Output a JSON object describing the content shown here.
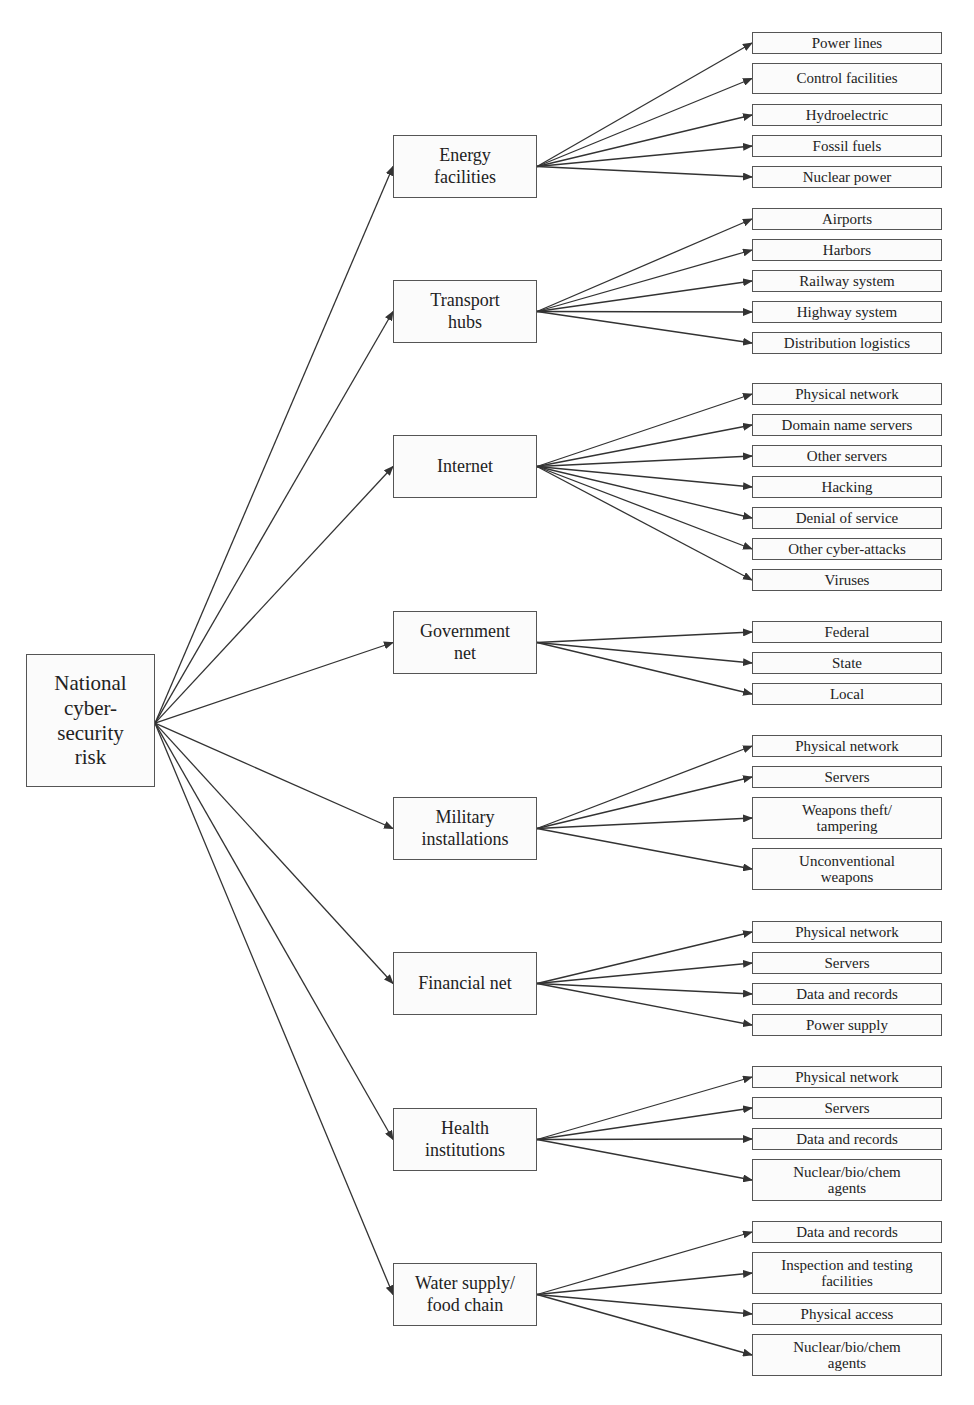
{
  "diagram": {
    "root": {
      "label": "National\ncyber-\nsecurity\nrisk",
      "x": 26,
      "y": 654,
      "w": 129,
      "h": 133
    },
    "colors": {
      "line": "#333333",
      "border": "#555555",
      "fill": "#fbfbfb"
    },
    "categories": [
      {
        "label": "Energy\nfacilities",
        "x": 393,
        "y": 135,
        "w": 144,
        "h": 63,
        "children": [
          {
            "label": "Power lines",
            "y": 32,
            "h": 22
          },
          {
            "label": "Control facilities",
            "y": 63,
            "h": 31
          },
          {
            "label": "Hydroelectric",
            "y": 104,
            "h": 22
          },
          {
            "label": "Fossil fuels",
            "y": 135,
            "h": 22
          },
          {
            "label": "Nuclear power",
            "y": 166,
            "h": 22
          }
        ]
      },
      {
        "label": "Transport\nhubs",
        "x": 393,
        "y": 280,
        "w": 144,
        "h": 63,
        "children": [
          {
            "label": "Airports",
            "y": 208,
            "h": 22
          },
          {
            "label": "Harbors",
            "y": 239,
            "h": 22
          },
          {
            "label": "Railway system",
            "y": 270,
            "h": 22
          },
          {
            "label": "Highway system",
            "y": 301,
            "h": 22
          },
          {
            "label": "Distribution logistics",
            "y": 332,
            "h": 22
          }
        ]
      },
      {
        "label": "Internet",
        "x": 393,
        "y": 435,
        "w": 144,
        "h": 63,
        "children": [
          {
            "label": "Physical network",
            "y": 383,
            "h": 22
          },
          {
            "label": "Domain name servers",
            "y": 414,
            "h": 22
          },
          {
            "label": "Other servers",
            "y": 445,
            "h": 22
          },
          {
            "label": "Hacking",
            "y": 476,
            "h": 22
          },
          {
            "label": "Denial of service",
            "y": 507,
            "h": 22
          },
          {
            "label": "Other cyber-attacks",
            "y": 538,
            "h": 22
          },
          {
            "label": "Viruses",
            "y": 569,
            "h": 22
          }
        ]
      },
      {
        "label": "Government\nnet",
        "x": 393,
        "y": 611,
        "w": 144,
        "h": 63,
        "children": [
          {
            "label": "Federal",
            "y": 621,
            "h": 22
          },
          {
            "label": "State",
            "y": 652,
            "h": 22
          },
          {
            "label": "Local",
            "y": 683,
            "h": 22
          }
        ]
      },
      {
        "label": "Military\ninstallations",
        "x": 393,
        "y": 797,
        "w": 144,
        "h": 63,
        "children": [
          {
            "label": "Physical network",
            "y": 735,
            "h": 22
          },
          {
            "label": "Servers",
            "y": 766,
            "h": 22
          },
          {
            "label": "Weapons theft/\ntampering",
            "y": 797,
            "h": 42
          },
          {
            "label": "Unconventional\nweapons",
            "y": 848,
            "h": 42
          }
        ]
      },
      {
        "label": "Financial net",
        "x": 393,
        "y": 952,
        "w": 144,
        "h": 63,
        "children": [
          {
            "label": "Physical network",
            "y": 921,
            "h": 22
          },
          {
            "label": "Servers",
            "y": 952,
            "h": 22
          },
          {
            "label": "Data and records",
            "y": 983,
            "h": 22
          },
          {
            "label": "Power  supply",
            "y": 1014,
            "h": 22
          }
        ]
      },
      {
        "label": "Health\ninstitutions",
        "x": 393,
        "y": 1108,
        "w": 144,
        "h": 63,
        "children": [
          {
            "label": "Physical network",
            "y": 1066,
            "h": 22
          },
          {
            "label": "Servers",
            "y": 1097,
            "h": 22
          },
          {
            "label": "Data and records",
            "y": 1128,
            "h": 22
          },
          {
            "label": "Nuclear/bio/chem\nagents",
            "y": 1159,
            "h": 42
          }
        ]
      },
      {
        "label": "Water supply/\nfood chain",
        "x": 393,
        "y": 1263,
        "w": 144,
        "h": 63,
        "children": [
          {
            "label": "Data and records",
            "y": 1221,
            "h": 22
          },
          {
            "label": "Inspection and testing\nfacilities",
            "y": 1252,
            "h": 42
          },
          {
            "label": "Physical access",
            "y": 1303,
            "h": 22
          },
          {
            "label": "Nuclear/bio/chem\nagents",
            "y": 1334,
            "h": 42
          }
        ]
      }
    ],
    "leaf_column": {
      "x": 752,
      "w": 190
    }
  }
}
